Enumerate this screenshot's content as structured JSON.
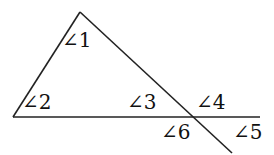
{
  "diagram": {
    "type": "triangle-with-extended-sides",
    "stroke_color": "#222222",
    "labels": {
      "a1": "∠1",
      "a2": "∠2",
      "a3": "∠3",
      "a4": "∠4",
      "a5": "∠5",
      "a6": "∠6"
    }
  }
}
